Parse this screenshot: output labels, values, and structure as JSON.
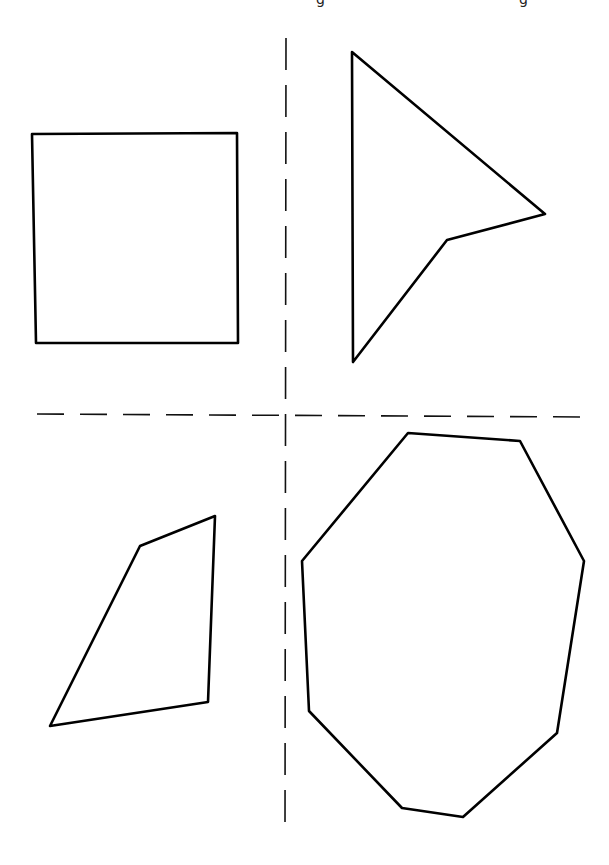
{
  "figure": {
    "background": "#ffffff",
    "stroke_color": "#000000",
    "top_fragments": [
      {
        "x": 318,
        "text": "g"
      },
      {
        "x": 521,
        "text": "g"
      }
    ],
    "dividers": {
      "vertical": {
        "x1": 286,
        "y1": 38,
        "x2": 285,
        "y2": 830,
        "dash": "32 15"
      },
      "horizontal": {
        "x1": 37,
        "y1": 414,
        "x2": 585,
        "y2": 417,
        "dash": "27 16"
      }
    },
    "shapes": [
      {
        "id": "square",
        "quadrant": "top-left",
        "points": "32,134 237,133 238,343 36,343"
      },
      {
        "id": "arrow-concave-quadrilateral",
        "quadrant": "top-right",
        "points": "352,52 545,214 447,240 353,362"
      },
      {
        "id": "irregular-quadrilateral",
        "quadrant": "bottom-left",
        "points": "140,546 215,516 208,702 50,726"
      },
      {
        "id": "irregular-octagon",
        "quadrant": "bottom-right",
        "points": "408,433 520,441 584,561 557,733 463,817 402,808 309,711 302,561"
      }
    ]
  }
}
